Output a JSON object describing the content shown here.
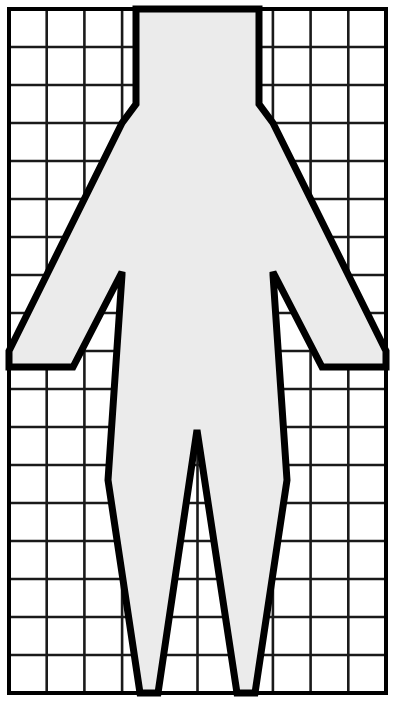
{
  "document": {
    "title": "Human Figure Grid Pattern",
    "description": "Black-and-white graph-paper drawing of a symmetric human figure silhouette drawn over a rectangular grid.",
    "width": 397,
    "height": 712
  },
  "canvas": {
    "background_color": "#ffffff",
    "border_color": "#000000",
    "border_width": 4,
    "plot_left": 9,
    "plot_top": 9,
    "plot_right": 386,
    "plot_bottom": 693
  },
  "grid": {
    "columns": 10,
    "rows": 18,
    "line_color": "#1a1a1a",
    "line_width": 2.6,
    "cell_width": 37.7,
    "cell_height": 38.0,
    "show_grid": true,
    "x_positions": [
      9,
      46.7,
      84.4,
      122.1,
      159.8,
      197.5,
      235.2,
      272.9,
      310.6,
      348.3,
      386
    ],
    "y_positions": [
      9,
      47,
      85,
      123,
      161,
      199,
      237,
      275,
      313,
      351,
      389,
      427,
      465,
      503,
      541,
      579,
      617,
      655,
      693
    ]
  },
  "figure": {
    "name": "human-figure-silhouette",
    "fill_color": "#ebebeb",
    "stroke_color": "#000000",
    "stroke_width": 7,
    "symmetry": "bilateral-vertical",
    "center_x": 197.5,
    "outline_points": [
      [
        136,
        9
      ],
      [
        136,
        104
      ],
      [
        122,
        123
      ],
      [
        9,
        351
      ],
      [
        9,
        367
      ],
      [
        73,
        367
      ],
      [
        122,
        272
      ],
      [
        122,
        275
      ],
      [
        108,
        480
      ],
      [
        140,
        693
      ],
      [
        158,
        693
      ],
      [
        197,
        430
      ],
      [
        237,
        693
      ],
      [
        255,
        693
      ],
      [
        287,
        480
      ],
      [
        273,
        275
      ],
      [
        273,
        272
      ],
      [
        322,
        367
      ],
      [
        386,
        367
      ],
      [
        386,
        351
      ],
      [
        273,
        123
      ],
      [
        259,
        104
      ],
      [
        259,
        9
      ]
    ],
    "parts": [
      {
        "name": "neck-torso-top",
        "top_left_x": 136,
        "top_right_x": 259,
        "top_y": 9,
        "bottom_y": 104
      },
      {
        "name": "left-shoulder",
        "from": [
          136,
          104
        ],
        "to": [
          122,
          123
        ]
      },
      {
        "name": "right-shoulder",
        "from": [
          259,
          104
        ],
        "to": [
          273,
          123
        ]
      },
      {
        "name": "left-arm-outer",
        "from": [
          122,
          123
        ],
        "to": [
          9,
          351
        ]
      },
      {
        "name": "left-hand-end",
        "from": [
          9,
          351
        ],
        "to": [
          9,
          367
        ]
      },
      {
        "name": "left-arm-under",
        "from": [
          9,
          367
        ],
        "to": [
          73,
          367
        ]
      },
      {
        "name": "left-armpit-rise",
        "from": [
          73,
          367
        ],
        "to": [
          122,
          272
        ]
      },
      {
        "name": "right-arm-outer",
        "from": [
          273,
          123
        ],
        "to": [
          386,
          351
        ]
      },
      {
        "name": "right-hand-end",
        "from": [
          386,
          351
        ],
        "to": [
          386,
          367
        ]
      },
      {
        "name": "right-arm-under",
        "from": [
          386,
          367
        ],
        "to": [
          322,
          367
        ]
      },
      {
        "name": "right-armpit-rise",
        "from": [
          322,
          367
        ],
        "to": [
          273,
          272
        ]
      },
      {
        "name": "left-body-side",
        "from": [
          122,
          275
        ],
        "to": [
          108,
          480
        ]
      },
      {
        "name": "right-body-side",
        "from": [
          273,
          275
        ],
        "to": [
          287,
          480
        ]
      },
      {
        "name": "left-leg-outer",
        "from": [
          108,
          480
        ],
        "to": [
          140,
          693
        ]
      },
      {
        "name": "right-leg-outer",
        "from": [
          287,
          480
        ],
        "to": [
          255,
          693
        ]
      },
      {
        "name": "crotch-apex",
        "point": [
          197,
          430
        ]
      },
      {
        "name": "left-leg-inner",
        "from": [
          197,
          430
        ],
        "to": [
          158,
          693
        ]
      },
      {
        "name": "right-leg-inner",
        "from": [
          197,
          430
        ],
        "to": [
          237,
          693
        ]
      }
    ]
  },
  "chart_data": {
    "type": "table",
    "title": "Human Figure Grid Pattern",
    "xlabel": "",
    "ylabel": "",
    "grid": true,
    "columns": 10,
    "rows": 18
  }
}
